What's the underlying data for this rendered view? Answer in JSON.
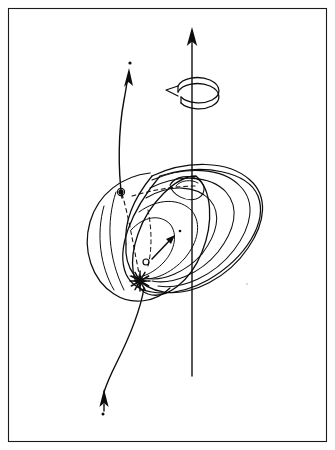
{
  "figure": {
    "domain": "Diagram",
    "title": "",
    "caption": "",
    "background_color": "#ffffff",
    "ink_color": "#0d0d0d",
    "frame_color": "#1a1a1a",
    "style": "hand-drawn line art, monochrome, no labels",
    "frame": {
      "name": "border-frame",
      "x": 8,
      "y": 8,
      "width": 319,
      "height": 434,
      "stroke_width": 1.1
    },
    "elements": {
      "spin_axis": {
        "name": "spin-axis",
        "description": "vertical straight line with arrowhead at top",
        "x": 192,
        "y_top": 28,
        "y_bottom": 376,
        "arrow_at": "top"
      },
      "rotation_arrow": {
        "name": "rotation-arrow",
        "description": "open circular arrow encircling the spin axis indicating rotation direction",
        "center_x": 192,
        "center_y": 90,
        "rx": 22,
        "ry": 9,
        "arrow_direction": "counter-clockwise-left"
      },
      "shells": {
        "name": "nested-shells",
        "description": "family of nested ellipsoidal field-line shells around the central body",
        "count": 5
      },
      "core_ellipse": {
        "name": "core-ellipse",
        "description": "small inner ellipse near the axis at the top of the shell stack",
        "center_x": 184,
        "center_y": 186
      },
      "body_disc": {
        "name": "body-disc",
        "description": "large tilted ellipse forming the front face of the body",
        "center_x": 176,
        "center_y": 232
      },
      "outer_lobe": {
        "name": "outer-lobe",
        "description": "large outer teardrop lobe extending to the right",
        "extent_right_x": 262
      },
      "dashed_path": {
        "name": "dashed-trajectory",
        "description": "dashed curve running from the upper marker down to the burst point",
        "style": "dashed"
      },
      "marker_upper": {
        "name": "marker-upper-point",
        "description": "small filled circle marker on the upper-left shell",
        "x": 121,
        "y": 192,
        "r": 2.6
      },
      "marker_lower": {
        "name": "marker-lower-point",
        "description": "small open circle marker near the burst",
        "x": 146,
        "y": 262,
        "r": 2.4
      },
      "burst": {
        "name": "burst-starburst",
        "description": "starburst / explosion symbol at the lower-left of the body",
        "x": 140,
        "y": 281,
        "spikes": 12
      },
      "interior_arrow": {
        "name": "interior-direction-arrow",
        "description": "short straight arrow inside the body pointing up and to the right from the lower marker",
        "from_x": 152,
        "from_y": 258,
        "to_x": 174,
        "to_y": 236
      },
      "trajectory_upper": {
        "name": "trajectory-upper-curve",
        "description": "curved trajectory leaving the body toward the upper left, arrowhead pointing up, terminal dot above",
        "arrow_x": 127,
        "arrow_y": 70,
        "dot_x": 130,
        "dot_y": 64
      },
      "trajectory_lower": {
        "name": "trajectory-lower-curve",
        "description": "curved trajectory descending below the body, arrowhead pointing up near the lower end, terminal dot below",
        "arrow_x": 104,
        "arrow_y": 396,
        "dot_x": 103,
        "dot_y": 408
      }
    }
  }
}
